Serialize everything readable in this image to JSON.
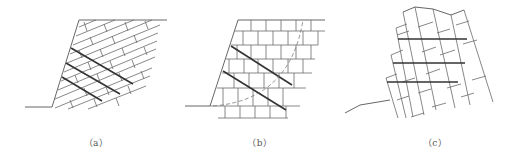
{
  "figure": {
    "panels": [
      {
        "id": "a",
        "caption": "（a）",
        "description": "Slope with rock layers dipping into the slope (stepped brick pattern), three bold continuous joints"
      },
      {
        "id": "b",
        "caption": "（b）",
        "description": "Slope in blocky rock mass with horizontal layering, two bold inclined joints and a dashed circular slip surface"
      },
      {
        "id": "c",
        "caption": "（c）",
        "description": "Toppling rock columns with three bold horizontal lines"
      }
    ],
    "colors": {
      "line": "#6a6a6a",
      "bold_line": "#333333",
      "background": "#ffffff"
    }
  }
}
